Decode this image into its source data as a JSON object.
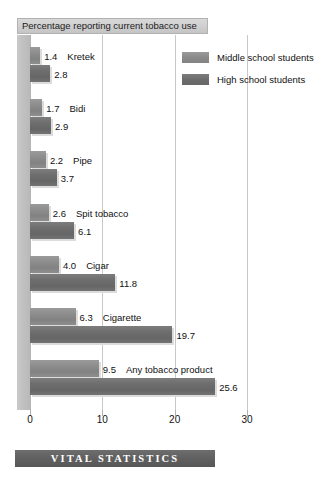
{
  "chart_data": {
    "type": "bar",
    "orientation": "horizontal",
    "title": "Percentage reporting current tobacco use",
    "xlabel": "",
    "ylabel": "",
    "xlim": [
      0,
      30
    ],
    "xticks": [
      0,
      10,
      20,
      30
    ],
    "xtick_labels": [
      "0",
      "10",
      "20",
      "30"
    ],
    "grid": true,
    "legend_position": "top-right",
    "categories": [
      "Kretek",
      "Bidi",
      "Pipe",
      "Spit tobacco",
      "Cigar",
      "Cigarette",
      "Any tobacco product"
    ],
    "series": [
      {
        "name": "Middle school students",
        "color": "#8a8a8a",
        "values": [
          1.4,
          1.7,
          2.2,
          2.6,
          4.0,
          6.3,
          9.5
        ],
        "value_labels": [
          "1.4",
          "1.7",
          "2.2",
          "2.6",
          "4.0",
          "6.3",
          "9.5"
        ]
      },
      {
        "name": "High school students",
        "color": "#6c6c6c",
        "values": [
          2.8,
          2.9,
          3.7,
          6.1,
          11.8,
          19.7,
          25.6
        ],
        "value_labels": [
          "2.8",
          "2.9",
          "3.7",
          "6.1",
          "11.8",
          "19.7",
          "25.6"
        ]
      }
    ]
  },
  "legend": {
    "items": [
      {
        "label": "Middle school students",
        "series": "middle"
      },
      {
        "label": "High school students",
        "series": "high"
      }
    ]
  },
  "banner": {
    "text": "VITAL STATISTICS"
  }
}
